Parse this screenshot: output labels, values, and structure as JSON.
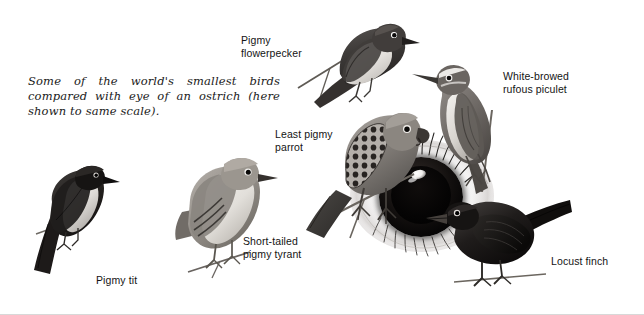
{
  "plate": {
    "width": 644,
    "height": 315,
    "background": "#ffffff",
    "border_color": "#d8d8d8"
  },
  "caption": {
    "text": "Some of the world's smallest birds compared with eye of an ostrich (here shown to same scale)."
  },
  "labels": {
    "flowerpecker": "Pigmy\nflowerpecker",
    "piculet": "White-browed\nrufous piculet",
    "parrot": "Least pigmy\nparrot",
    "tyrant": "Short-tailed\npigmy tyrant",
    "tit": "Pigmy tit",
    "finch": "Locust finch"
  },
  "subjects": [
    {
      "id": "pigmy-flowerpecker",
      "name": "Pigmy flowerpecker",
      "label": "Pigmy\nflowerpecker",
      "position": "top-center",
      "perched_on": "thin twig",
      "plumage": "dark slate-grey back and crown, pale cream underparts"
    },
    {
      "id": "white-browed-rufous-piculet",
      "name": "White-browed rufous piculet",
      "label": "White-browed\nrufous piculet",
      "position": "right",
      "perched_on": "upright stem",
      "plumage": "mid grey-brown upperparts, pale white eyebrow stripe, buff underparts"
    },
    {
      "id": "least-pigmy-parrot",
      "name": "Least pigmy parrot",
      "label": "Least pigmy\nparrot",
      "position": "center",
      "perched_on": "branch above ostrich eye",
      "plumage": "grey body with dark scalloped wing panel, hooked bill"
    },
    {
      "id": "short-tailed-pigmy-tyrant",
      "name": "Short-tailed pigmy tyrant",
      "label": "Short-tailed\npigmy tyrant",
      "position": "center-left",
      "perched_on": "thin twig",
      "plumage": "plump pale grey-brown, darker wing bars, short tail"
    },
    {
      "id": "pigmy-tit",
      "name": "Pigmy tit",
      "label": "Pigmy tit",
      "position": "left",
      "perched_on": "thin twig",
      "plumage": "near-black crown, back and long tail, white breast"
    },
    {
      "id": "locust-finch",
      "name": "Locust finch",
      "label": "Locust finch",
      "position": "bottom-right",
      "perched_on": "twig",
      "plumage": "very dark, almost black overall, stout conical bill"
    },
    {
      "id": "ostrich-eye",
      "name": "Ostrich eye",
      "label": "",
      "position": "center",
      "perched_on": "",
      "plumage": "large eye with black iris, white sclera and radiating lashes, shown to same scale"
    }
  ],
  "colors": {
    "ink": "#141414",
    "caption_ink": "#1a1a1a",
    "paper": "#ffffff",
    "iris": "#0b0908",
    "twig": "#6d6a63"
  }
}
